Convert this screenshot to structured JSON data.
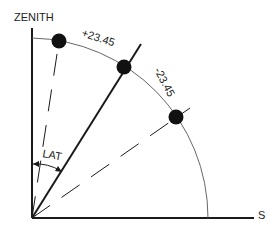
{
  "diagram": {
    "labels": {
      "zenith": "ZENITH",
      "south": "S",
      "latitude": "LAT",
      "summer_declination": "+23.45",
      "winter_declination": "-23.45"
    },
    "colors": {
      "line": "#1a1a1a",
      "arc": "#555555",
      "dot": "#111111",
      "background": "#ffffff"
    },
    "positions": [
      {
        "name": "summer-solstice-sun",
        "declination": 23.45
      },
      {
        "name": "equinox-sun",
        "declination": 0
      },
      {
        "name": "winter-solstice-sun",
        "declination": -23.45
      }
    ]
  }
}
